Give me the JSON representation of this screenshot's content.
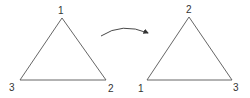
{
  "diagram": {
    "left_triangle": {
      "labels": {
        "top": "1",
        "bottom_left": "3",
        "bottom_right": "2"
      }
    },
    "arrow": {
      "direction": "clockwise-rotation"
    },
    "right_triangle": {
      "labels": {
        "top": "2",
        "bottom_left": "1",
        "bottom_right": "3"
      }
    },
    "colors": {
      "stroke": "#444444",
      "text": "#333333"
    }
  }
}
